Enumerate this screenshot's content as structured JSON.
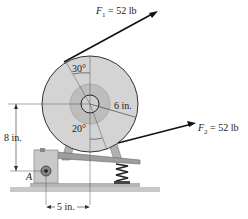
{
  "diagram": {
    "forces": {
      "f1": {
        "symbol": "F",
        "sub": "1",
        "value": "= 52 lb"
      },
      "f2": {
        "symbol": "F",
        "sub": "2",
        "value": "= 52 lb"
      }
    },
    "angles": {
      "top": "30°",
      "bottom": "20°"
    },
    "dimensions": {
      "radius": "6 in.",
      "height": "8 in.",
      "horizontal": "5 in."
    },
    "points": {
      "pin": "A"
    },
    "colors": {
      "disk": "#d4d4d4",
      "hub": "#bdbdbd",
      "frame": "#a9a9a9",
      "ground": "#c8c8c8",
      "arrow": "#111111"
    }
  }
}
